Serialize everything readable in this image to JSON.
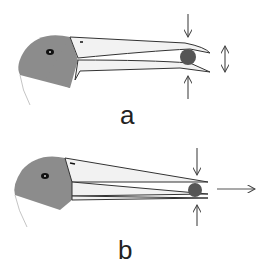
{
  "panels": [
    {
      "id": "a",
      "label": "a",
      "description": "Beak open, food item held at tip; forces compress beak tips; tips move apart"
    },
    {
      "id": "b",
      "label": "b",
      "description": "Beak closed, food item at tip; forces compress; food pushed outward along beak"
    }
  ],
  "colors": {
    "head": "#8c8c8c",
    "beak_fill": "#f2f2f2",
    "outline": "#333333",
    "food": "#555555",
    "arrow": "#555555"
  }
}
